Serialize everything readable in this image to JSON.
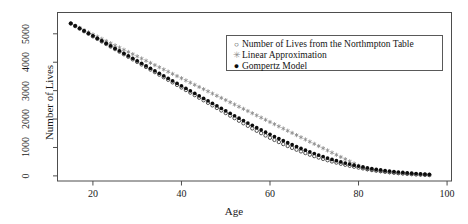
{
  "chart_data": {
    "type": "scatter",
    "title": "",
    "xlabel": "Age",
    "ylabel": "Number of Lives",
    "xlim": [
      12,
      101
    ],
    "ylim": [
      -180,
      5750
    ],
    "xticks": [
      20,
      40,
      60,
      80,
      100
    ],
    "yticks": [
      0,
      1000,
      2000,
      3000,
      4000,
      5000
    ],
    "grid": false,
    "legend_position": "top-right",
    "x": [
      15,
      16,
      17,
      18,
      19,
      20,
      21,
      22,
      23,
      24,
      25,
      26,
      27,
      28,
      29,
      30,
      31,
      32,
      33,
      34,
      35,
      36,
      37,
      38,
      39,
      40,
      41,
      42,
      43,
      44,
      45,
      46,
      47,
      48,
      49,
      50,
      51,
      52,
      53,
      54,
      55,
      56,
      57,
      58,
      59,
      60,
      61,
      62,
      63,
      64,
      65,
      66,
      67,
      68,
      69,
      70,
      71,
      72,
      73,
      74,
      75,
      76,
      77,
      78,
      79,
      80,
      81,
      82,
      83,
      84,
      85,
      86,
      87,
      88,
      89,
      90,
      91,
      92,
      93,
      94,
      95,
      96
    ],
    "series": [
      {
        "name": "Number of Lives from the Northmpton Table",
        "marker": "open-circle",
        "color": "#2b2b2b",
        "values": [
          5362,
          5272,
          5182,
          5092,
          5002,
          4912,
          4822,
          4732,
          4642,
          4552,
          4462,
          4372,
          4282,
          4192,
          4102,
          4012,
          3922,
          3832,
          3742,
          3652,
          3562,
          3472,
          3382,
          3292,
          3202,
          3112,
          3022,
          2932,
          2842,
          2752,
          2662,
          2572,
          2482,
          2392,
          2302,
          2212,
          2122,
          2032,
          1942,
          1852,
          1762,
          1672,
          1588,
          1504,
          1422,
          1342,
          1266,
          1192,
          1120,
          1052,
          986,
          922,
          862,
          804,
          748,
          696,
          646,
          598,
          552,
          508,
          468,
          428,
          392,
          356,
          324,
          292,
          264,
          236,
          212,
          188,
          168,
          148,
          130,
          114,
          98,
          86,
          74,
          62,
          52,
          44,
          36,
          28
        ]
      },
      {
        "name": "Linear Approximation",
        "marker": "asterisk",
        "color": "#8a8a8a",
        "values": [
          5362,
          5285,
          5208,
          5131,
          5054,
          4977,
          4900,
          4823,
          4746,
          4669,
          4592,
          4515,
          4438,
          4361,
          4284,
          4207,
          4130,
          4053,
          3976,
          3899,
          3822,
          3745,
          3668,
          3591,
          3514,
          3437,
          3360,
          3283,
          3206,
          3129,
          3052,
          2975,
          2898,
          2821,
          2744,
          2667,
          2590,
          2513,
          2436,
          2359,
          2282,
          2205,
          2128,
          2051,
          1974,
          1897,
          1820,
          1743,
          1666,
          1589,
          1512,
          1435,
          1358,
          1281,
          1204,
          1127,
          1050,
          973,
          896,
          819,
          742,
          665,
          588,
          511,
          434,
          357,
          280,
          225,
          200,
          178,
          158,
          140,
          124,
          110,
          97,
          86,
          76,
          66,
          57,
          49,
          42,
          35
        ]
      },
      {
        "name": "Gompertz Model",
        "marker": "filled-circle",
        "color": "#0d0d0d",
        "values": [
          5370,
          5282,
          5194,
          5106,
          5018,
          4930,
          4842,
          4754,
          4666,
          4578,
          4490,
          4402,
          4314,
          4226,
          4138,
          4050,
          3962,
          3874,
          3786,
          3698,
          3610,
          3522,
          3434,
          3346,
          3258,
          3170,
          3082,
          2994,
          2906,
          2818,
          2730,
          2642,
          2554,
          2466,
          2378,
          2290,
          2202,
          2116,
          2030,
          1946,
          1862,
          1780,
          1698,
          1618,
          1540,
          1462,
          1386,
          1312,
          1240,
          1170,
          1100,
          1034,
          968,
          906,
          846,
          788,
          732,
          678,
          628,
          580,
          534,
          492,
          452,
          414,
          378,
          344,
          314,
          284,
          258,
          232,
          210,
          188,
          170,
          152,
          136,
          122,
          108,
          96,
          84,
          74,
          64,
          56
        ]
      }
    ]
  },
  "legend": {
    "entries": [
      {
        "marker_glyph": "○",
        "label": "Number of Lives from the Northmpton Table"
      },
      {
        "marker_glyph": "✳",
        "label": "Linear Approximation"
      },
      {
        "marker_glyph": "●",
        "label": "Gompertz Model"
      }
    ]
  },
  "axes": {
    "x_title": "Age",
    "y_title": "Number of Lives",
    "x_tick_labels": [
      "20",
      "40",
      "60",
      "80",
      "100"
    ],
    "y_tick_labels": [
      "0",
      "1000",
      "2000",
      "3000",
      "4000",
      "5000"
    ]
  },
  "colors": {
    "frame": "#4d4d4d",
    "text": "#1a1a1a",
    "table_marker": "#2b2b2b",
    "linear_marker": "#8a8a8a",
    "gompertz_marker": "#0d0d0d",
    "background": "#ffffff"
  }
}
